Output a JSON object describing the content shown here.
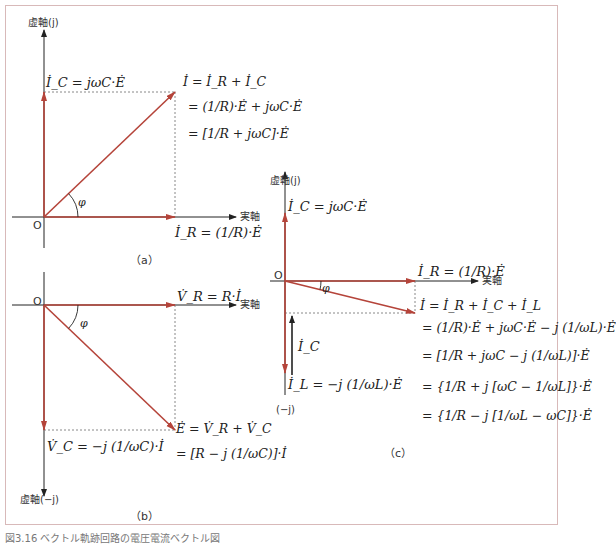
{
  "colors": {
    "vector": "#b5443a",
    "axis": "#222222",
    "dotted": "#888888",
    "frame": "#d8b9b9"
  },
  "panel_a": {
    "caption": "（a）",
    "imag_axis_label": "虚軸(j)",
    "real_axis_label": "実軸",
    "origin_label": "O",
    "angle_label": "φ",
    "ic_label": "İ_C = jωC·Ė",
    "ir_label": "İ_R = (1/R)·Ė",
    "i_eq_lines": [
      "İ = İ_R + İ_C",
      "= (1/R)·Ė + jωC·Ė",
      "= [1/R + jωC]·Ė"
    ]
  },
  "panel_b": {
    "caption": "（b）",
    "imag_axis_label": "虚軸(−j)",
    "real_axis_label": "実軸",
    "origin_label": "O",
    "angle_label": "φ",
    "vr_label": "V̇_R = R·İ",
    "vc_label": "V̇_C = −j (1/ωC)·İ",
    "e_eq_lines": [
      "Ė = V̇_R + V̇_C",
      "= [R − j (1/ωC)]·İ"
    ]
  },
  "panel_c": {
    "caption": "（c）",
    "imag_axis_label": "虚軸(j)",
    "neg_imag_label": "(−j)",
    "real_axis_label": "実軸",
    "origin_label": "O",
    "angle_label": "φ",
    "ic_label": "İ_C = jωC·Ė",
    "ic_short_label": "İ_C",
    "ir_label": "İ_R = (1/R)·Ė",
    "il_label": "İ_L = −j (1/ωL)·Ė",
    "i_eq_lines": [
      "İ = İ_R + İ_C + İ_L",
      "= (1/R)·Ė + jωC·Ė − j (1/ωL)·Ė",
      "= [1/R + jωC − j (1/ωL)]·Ė",
      "= {1/R + j [ωC − 1/ωL]}·Ė",
      "= {1/R − j [1/ωL − ωC]}·Ė"
    ]
  },
  "figure_caption": "図3.16 ベクトル軌跡回路の電圧電流ベクトル図"
}
